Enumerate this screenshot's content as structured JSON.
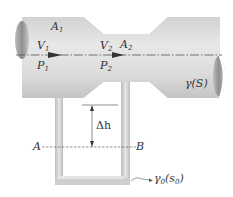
{
  "diagram": {
    "labels": {
      "area_inlet": "A",
      "area_inlet_sub": "1",
      "area_throat": "A",
      "area_throat_sub": "2",
      "velocity_inlet": "V",
      "velocity_inlet_sub": "1",
      "velocity_throat": "V",
      "velocity_throat_sub": "2",
      "pressure_inlet": "P",
      "pressure_inlet_sub": "1",
      "pressure_throat": "P",
      "pressure_throat_sub": "2",
      "fluid": "γ(S)",
      "height_difference": "Δh",
      "point_a": "A",
      "point_b": "B",
      "manometer_fluid": "γ",
      "manometer_fluid_sub": "0",
      "manometer_fluid_paren": "(s",
      "manometer_fluid_paren_sub": "0",
      "manometer_fluid_close": ")"
    },
    "colors": {
      "pipe_light": "#e6e6e6",
      "pipe_mid": "#cfcfcf",
      "pipe_dark": "#a8a8a8",
      "line": "#444444"
    }
  }
}
